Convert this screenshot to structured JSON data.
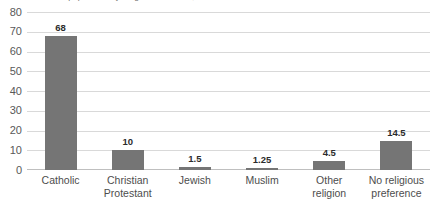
{
  "chart_data": {
    "type": "bar",
    "title": "Percent of population by religious affiliation, 2010",
    "xlabel": "",
    "ylabel": "",
    "ylim": [
      0,
      80
    ],
    "ytick_step": 10,
    "yticks": [
      80,
      70,
      60,
      50,
      40,
      30,
      20,
      10,
      0
    ],
    "grid": true,
    "legend": false,
    "bar_color": "#757575",
    "gridline_color": "#d9d9d9",
    "categories": [
      "Catholic",
      "Christian Protestant",
      "Jewish",
      "Muslim",
      "Other religion",
      "No religious preference"
    ],
    "category_lines": [
      [
        "Catholic"
      ],
      [
        "Christian",
        "Protestant"
      ],
      [
        "Jewish"
      ],
      [
        "Muslim"
      ],
      [
        "Other",
        "religion"
      ],
      [
        "No religious",
        "preference"
      ]
    ],
    "values": [
      68,
      10,
      1.5,
      1.25,
      4.5,
      14.5
    ],
    "data_labels": [
      "68",
      "10",
      "1.5",
      "1.25",
      "4.5",
      "14.5"
    ]
  }
}
